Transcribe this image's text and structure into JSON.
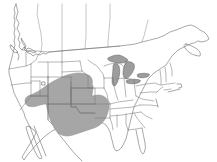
{
  "figure": {
    "type": "range-map",
    "region": "United States",
    "background_color": "#ffffff",
    "width": 217,
    "height": 162,
    "title": "",
    "caption": "",
    "has_frame": false,
    "has_legend": false,
    "has_labels": false
  },
  "style": {
    "land_fill": "#ffffff",
    "land_stroke": "#6e6e6e",
    "state_border_color": "#7a7a7a",
    "province_border_color": "#8d8d8d",
    "coastline_color": "#6a6a6a",
    "range_fill": "#a6a6a6",
    "range_stroke": "#8a8a8a",
    "lake_fill": "#9d9d9d",
    "lake_stroke": "#5d5d5d"
  },
  "layers": [
    {
      "name": "country-outline",
      "label": "United States and southern Canada landmass",
      "fill": "#ffffff",
      "stroke": "#6e6e6e"
    },
    {
      "name": "state-borders",
      "label": "State boundaries",
      "fill": "none",
      "stroke": "#7a7a7a"
    },
    {
      "name": "great-lakes",
      "label": "Great Lakes",
      "fill": "#9d9d9d",
      "stroke": "#5d5d5d"
    },
    {
      "name": "species-range",
      "label": "Shaded distribution range, southwestern and south-central United States",
      "fill": "#a6a6a6",
      "stroke": "#8a8a8a"
    }
  ],
  "range": {
    "name": "species-range",
    "description": "Shaded gray area covering the southwestern and south-central United States",
    "fill_color": "#a6a6a6",
    "covered_states": [
      "Arizona",
      "New Mexico",
      "Texas",
      "Oklahoma",
      "Kansas",
      "Colorado",
      "Utah",
      "Nevada",
      "Nebraska"
    ],
    "extent_note": "Extends from southern Nevada and southeastern California east across Arizona, New Mexico, Colorado, Kansas, Oklahoma and Texas to the western Gulf coast"
  },
  "lakes": [
    {
      "name": "Lake Superior"
    },
    {
      "name": "Lake Michigan"
    },
    {
      "name": "Lake Huron"
    },
    {
      "name": "Lake Erie"
    },
    {
      "name": "Lake Ontario"
    }
  ]
}
